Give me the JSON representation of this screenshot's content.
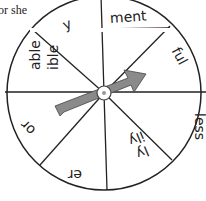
{
  "caption": "or she",
  "spinner": {
    "segments": [
      {
        "label": "ment",
        "angle": -22
      },
      {
        "label": "ful",
        "angle": 67
      },
      {
        "label": "less",
        "angle": 90
      },
      {
        "label": "ly",
        "sub": "ily",
        "angle": 157
      },
      {
        "label": "er",
        "angle": 180
      },
      {
        "label": "or",
        "angle": 225
      },
      {
        "label": "able",
        "sub": "ible",
        "angle": 270
      },
      {
        "label": "y",
        "angle": 337
      }
    ],
    "colors": {
      "line": "#222222",
      "arrow": "#8a8a8a",
      "background": "#ffffff"
    }
  }
}
